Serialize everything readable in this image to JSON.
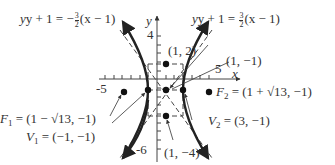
{
  "diagram": {
    "axes": {
      "x_label": "x",
      "y_label": "y",
      "tick_labels": {
        "x_neg": "-5",
        "x_pos": "5",
        "y_pos": "4",
        "y_neg": "-6"
      }
    },
    "asymptotes": {
      "left": {
        "lhs": "y + 1 = ",
        "sign": "−",
        "num": "3",
        "den": "2",
        "rhs": "(x − 1)"
      },
      "right": {
        "lhs": "y + 1 = ",
        "num": "3",
        "den": "2",
        "rhs": "(x − 1)"
      }
    },
    "points": {
      "center": {
        "label": "(1, −1)",
        "x": 1,
        "y": -1
      },
      "top": {
        "label": "(1, 2)",
        "x": 1,
        "y": 2
      },
      "bottom": {
        "label": "(1, −4)",
        "x": 1,
        "y": -4
      },
      "v1": {
        "name": "V",
        "sub": "1",
        "value": " = (−1, −1)",
        "x": -1,
        "y": -1
      },
      "v2": {
        "name": "V",
        "sub": "2",
        "value": " = (3, −1)",
        "x": 3,
        "y": -1
      },
      "f1": {
        "name": "F",
        "sub": "1",
        "value": " = (1 − √13, −1)",
        "x": -2.606,
        "y": -1
      },
      "f2": {
        "name": "F",
        "sub": "2",
        "value": " = (1 + √13, −1)",
        "x": 4.606,
        "y": -1
      }
    },
    "colors": {
      "curve": "#222222",
      "axis": "#444444",
      "text": "#333333"
    }
  }
}
